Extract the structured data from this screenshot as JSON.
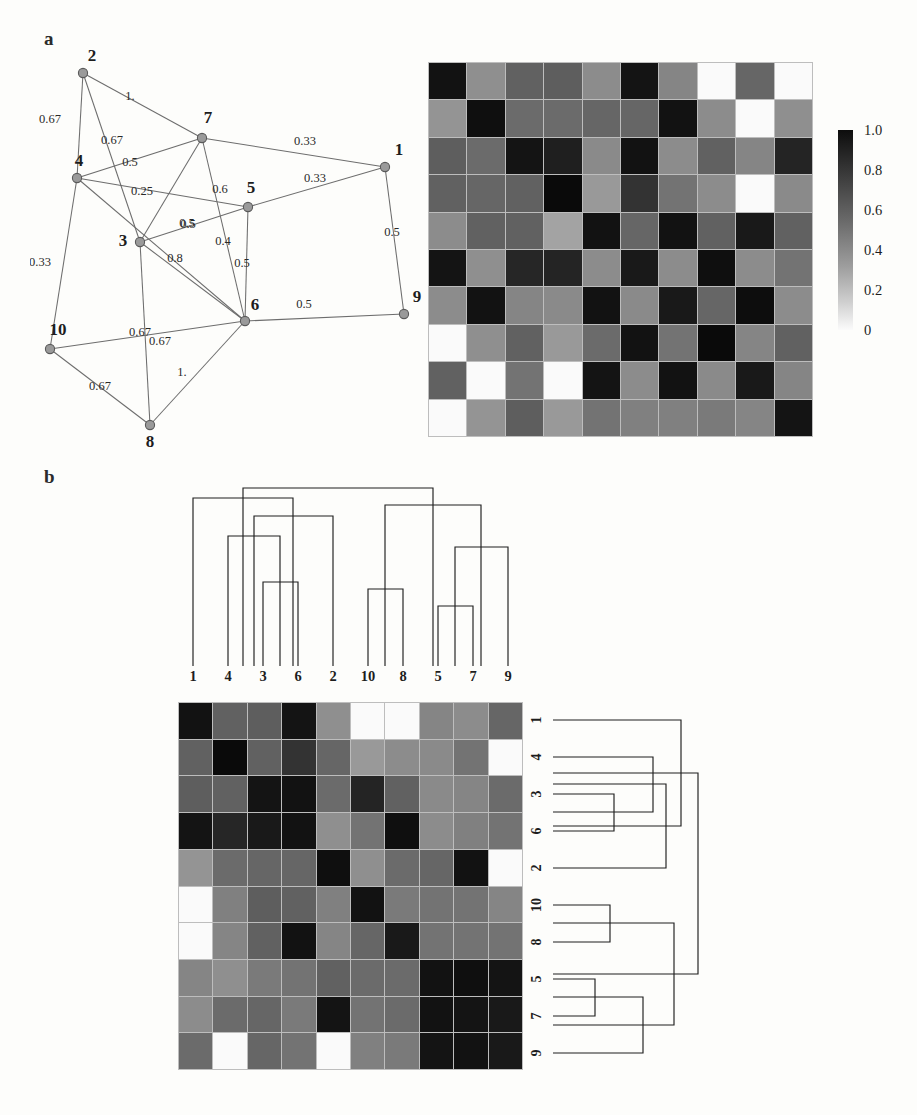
{
  "figure": {
    "panels": [
      {
        "id": "a",
        "letter": "a"
      },
      {
        "id": "b",
        "letter": "b"
      }
    ]
  },
  "panel_a": {
    "letter": "a",
    "graph": {
      "type": "weighted-undirected-network",
      "node_labels": [
        "1",
        "2",
        "3",
        "4",
        "5",
        "6",
        "7",
        "8",
        "9",
        "10"
      ],
      "nodes": [
        {
          "id": "1",
          "label": "1",
          "x": 355,
          "y": 127,
          "label_dx": 14,
          "label_dy": -12
        },
        {
          "id": "2",
          "label": "2",
          "x": 53,
          "y": 33,
          "label_dx": 9,
          "label_dy": -12
        },
        {
          "id": "3",
          "label": "3",
          "x": 110,
          "y": 202,
          "label_dx": -17,
          "label_dy": 4
        },
        {
          "id": "4",
          "label": "4",
          "x": 47,
          "y": 138,
          "label_dx": 2,
          "label_dy": -12
        },
        {
          "id": "5",
          "label": "5",
          "x": 218,
          "y": 167,
          "label_dx": 3,
          "label_dy": -14
        },
        {
          "id": "6",
          "label": "6",
          "x": 215,
          "y": 281,
          "label_dx": 10,
          "label_dy": -11
        },
        {
          "id": "7",
          "label": "7",
          "x": 172,
          "y": 98,
          "label_dx": 6,
          "label_dy": -15
        },
        {
          "id": "8",
          "label": "8",
          "x": 120,
          "y": 385,
          "label_dx": 0,
          "label_dy": 22
        },
        {
          "id": "9",
          "label": "9",
          "x": 374,
          "y": 274,
          "label_dx": 13,
          "label_dy": -12
        },
        {
          "id": "10",
          "label": "10",
          "x": 20,
          "y": 309,
          "label_dx": 8,
          "label_dy": -14
        }
      ],
      "edges": [
        {
          "source": "2",
          "target": "4",
          "weight": "0.67",
          "wx": 20,
          "wy": 83
        },
        {
          "source": "2",
          "target": "7",
          "weight": "1.",
          "wx": 100,
          "wy": 60
        },
        {
          "source": "2",
          "target": "3",
          "weight": "0.67",
          "wx": 82,
          "wy": 104
        },
        {
          "source": "4",
          "target": "7",
          "weight": "0.5",
          "wx": 100,
          "wy": 126
        },
        {
          "source": "4",
          "target": "5",
          "weight": "0.25",
          "wx": 112,
          "wy": 155
        },
        {
          "source": "4",
          "target": "10",
          "weight": "0.33",
          "wx": 10,
          "wy": 226
        },
        {
          "source": "7",
          "target": "1",
          "weight": "0.33",
          "wx": 275,
          "wy": 105
        },
        {
          "source": "7",
          "target": "6",
          "weight": "0.6",
          "wx": 190,
          "wy": 153
        },
        {
          "source": "7",
          "target": "3",
          "weight": "0.5",
          "wx": 157,
          "wy": 187
        },
        {
          "source": "5",
          "target": "1",
          "weight": "0.33",
          "wx": 285,
          "wy": 142
        },
        {
          "source": "5",
          "target": "3",
          "weight": "0.5",
          "wx": 158,
          "wy": 188
        },
        {
          "source": "5",
          "target": "6",
          "weight": "0.5",
          "wx": 212,
          "wy": 227
        },
        {
          "source": "3",
          "target": "6",
          "weight": "0.8",
          "wx": 145,
          "wy": 222
        },
        {
          "source": "3",
          "target": "8",
          "weight": "0.67",
          "wx": 110,
          "wy": 296
        },
        {
          "source": "6",
          "target": "9",
          "weight": "0.5",
          "wx": 274,
          "wy": 268
        },
        {
          "source": "6",
          "target": "10",
          "weight": "0.67",
          "wx": 130,
          "wy": 305
        },
        {
          "source": "6",
          "target": "8",
          "weight": "1.",
          "wx": 152,
          "wy": 336
        },
        {
          "source": "1",
          "target": "9",
          "weight": "0.5",
          "wx": 362,
          "wy": 196
        },
        {
          "source": "10",
          "target": "8",
          "weight": "0.67",
          "wx": 70,
          "wy": 350
        },
        {
          "source": "6",
          "target": "4",
          "weight": "0.4",
          "wx": 193,
          "wy": 205
        }
      ]
    },
    "heatmap": {
      "type": "heatmap",
      "title": "",
      "rows": 10,
      "cols": 10,
      "row_labels": [
        "1",
        "2",
        "3",
        "4",
        "5",
        "6",
        "7",
        "8",
        "9",
        "10"
      ],
      "col_labels": [
        "1",
        "2",
        "3",
        "4",
        "5",
        "6",
        "7",
        "8",
        "9",
        "10"
      ],
      "vmin": 0,
      "vmax": 1.0,
      "colormap": "grayscale-inverted",
      "values": [
        [
          0.93,
          0.44,
          0.62,
          0.63,
          0.45,
          0.92,
          0.48,
          0.02,
          0.6,
          0.02
        ],
        [
          0.42,
          0.94,
          0.58,
          0.58,
          0.6,
          0.6,
          0.93,
          0.45,
          0.02,
          0.44
        ],
        [
          0.63,
          0.58,
          0.92,
          0.88,
          0.46,
          0.93,
          0.45,
          0.62,
          0.48,
          0.86
        ],
        [
          0.62,
          0.6,
          0.62,
          0.96,
          0.4,
          0.8,
          0.55,
          0.45,
          0.02,
          0.46
        ],
        [
          0.45,
          0.62,
          0.62,
          0.36,
          0.93,
          0.6,
          0.93,
          0.62,
          0.9,
          0.62
        ],
        [
          0.92,
          0.44,
          0.85,
          0.86,
          0.45,
          0.9,
          0.45,
          0.94,
          0.45,
          0.55
        ],
        [
          0.45,
          0.93,
          0.48,
          0.46,
          0.93,
          0.46,
          0.9,
          0.6,
          0.95,
          0.45
        ],
        [
          0.02,
          0.44,
          0.62,
          0.4,
          0.58,
          0.93,
          0.55,
          0.96,
          0.48,
          0.62
        ],
        [
          0.62,
          0.02,
          0.55,
          0.02,
          0.92,
          0.45,
          0.93,
          0.46,
          0.9,
          0.48
        ],
        [
          0.02,
          0.42,
          0.63,
          0.4,
          0.55,
          0.5,
          0.5,
          0.52,
          0.48,
          0.92
        ]
      ]
    },
    "colorbar": {
      "ticks": [
        "1.0",
        "0.8",
        "0.6",
        "0.4",
        "0.2",
        "0"
      ],
      "tick_positions_pct": [
        0,
        20,
        40,
        60,
        80,
        100
      ],
      "top_color": "#0d0d0d",
      "bottom_color": "#fbfbfb"
    }
  },
  "panel_b": {
    "letter": "b",
    "dendrogram_top": {
      "orientation": "top",
      "leaf_labels": [
        "1",
        "4",
        "3",
        "6",
        "2",
        "10",
        "8",
        "5",
        "7",
        "9"
      ],
      "leaf_x": [
        13,
        48,
        83,
        118,
        153,
        188,
        223,
        258,
        293,
        328
      ],
      "merges": [
        {
          "left_x": 83,
          "right_x": 118,
          "y": 104,
          "note": "3 + 6"
        },
        {
          "left_x": 48,
          "right_x": 100,
          "y": 58,
          "note": "4 + (3,6)"
        },
        {
          "left_x": 74,
          "right_x": 153,
          "y": 38,
          "note": "(4,3,6) + 2"
        },
        {
          "left_x": 13,
          "right_x": 113,
          "y": 20,
          "note": "1 + (4,3,6,2)"
        },
        {
          "left_x": 188,
          "right_x": 223,
          "y": 111,
          "note": "10 + 8"
        },
        {
          "left_x": 258,
          "right_x": 293,
          "y": 128,
          "note": "5 + 7"
        },
        {
          "left_x": 275,
          "right_x": 328,
          "y": 69,
          "note": "(5,7) + 9"
        },
        {
          "left_x": 205,
          "right_x": 301,
          "y": 27,
          "note": "(10,8) + (5,7,9)"
        },
        {
          "left_x": 63,
          "right_x": 253,
          "y": 10,
          "note": "root"
        }
      ]
    },
    "heatmap": {
      "type": "heatmap",
      "title": "",
      "rows": 10,
      "cols": 10,
      "row_labels": [
        "1",
        "4",
        "3",
        "6",
        "2",
        "10",
        "8",
        "5",
        "7",
        "9"
      ],
      "col_labels": [
        "1",
        "4",
        "3",
        "6",
        "2",
        "10",
        "8",
        "5",
        "7",
        "9"
      ],
      "vmin": 0,
      "vmax": 1.0,
      "colormap": "grayscale-inverted",
      "values": [
        [
          0.93,
          0.62,
          0.63,
          0.92,
          0.44,
          0.02,
          0.02,
          0.48,
          0.45,
          0.6
        ],
        [
          0.62,
          0.96,
          0.62,
          0.8,
          0.6,
          0.4,
          0.45,
          0.46,
          0.55,
          0.02
        ],
        [
          0.63,
          0.62,
          0.92,
          0.93,
          0.58,
          0.86,
          0.62,
          0.46,
          0.48,
          0.58
        ],
        [
          0.92,
          0.85,
          0.9,
          0.93,
          0.44,
          0.55,
          0.94,
          0.45,
          0.5,
          0.55
        ],
        [
          0.42,
          0.58,
          0.6,
          0.6,
          0.94,
          0.44,
          0.58,
          0.6,
          0.93,
          0.02
        ],
        [
          0.02,
          0.5,
          0.63,
          0.62,
          0.5,
          0.93,
          0.52,
          0.55,
          0.55,
          0.48
        ],
        [
          0.02,
          0.48,
          0.62,
          0.93,
          0.48,
          0.6,
          0.9,
          0.55,
          0.55,
          0.55
        ],
        [
          0.48,
          0.44,
          0.52,
          0.55,
          0.62,
          0.58,
          0.58,
          0.93,
          0.94,
          0.92
        ],
        [
          0.45,
          0.58,
          0.6,
          0.52,
          0.92,
          0.55,
          0.58,
          0.93,
          0.92,
          0.9
        ],
        [
          0.58,
          0.02,
          0.6,
          0.55,
          0.02,
          0.5,
          0.52,
          0.92,
          0.93,
          0.9
        ]
      ]
    },
    "dendrogram_right": {
      "orientation": "right",
      "leaf_labels": [
        "1",
        "4",
        "3",
        "6",
        "2",
        "10",
        "8",
        "5",
        "7",
        "9"
      ],
      "leaf_y": [
        18,
        55,
        92,
        129,
        166,
        203,
        240,
        277,
        314,
        351
      ],
      "merges": [
        {
          "top_y": 92,
          "bottom_y": 129,
          "x": 61,
          "note": "3 + 6"
        },
        {
          "top_y": 55,
          "bottom_y": 110,
          "x": 100,
          "note": "4 + (3,6)"
        },
        {
          "top_y": 82,
          "bottom_y": 166,
          "x": 113,
          "note": "(4,3,6) + 2"
        },
        {
          "top_y": 18,
          "bottom_y": 124,
          "x": 128,
          "note": "1 + (4,3,6,2)"
        },
        {
          "top_y": 203,
          "bottom_y": 240,
          "x": 57,
          "note": "10 + 8"
        },
        {
          "top_y": 277,
          "bottom_y": 314,
          "x": 42,
          "note": "5 + 7"
        },
        {
          "top_y": 295,
          "bottom_y": 351,
          "x": 90,
          "note": "(5,7) + 9"
        },
        {
          "top_y": 221,
          "bottom_y": 323,
          "x": 121,
          "note": "(10,8) + (5,7,9)"
        },
        {
          "top_y": 71,
          "bottom_y": 272,
          "x": 145,
          "note": "root"
        }
      ]
    }
  },
  "style": {
    "node_fill": "#9a9a9a",
    "node_stroke": "#5a5a5a",
    "edge_color": "#6d6d6d",
    "dendro_color": "#1f1f1f",
    "grid_line": "#bdbdbd",
    "background": "#fdfdfb"
  }
}
